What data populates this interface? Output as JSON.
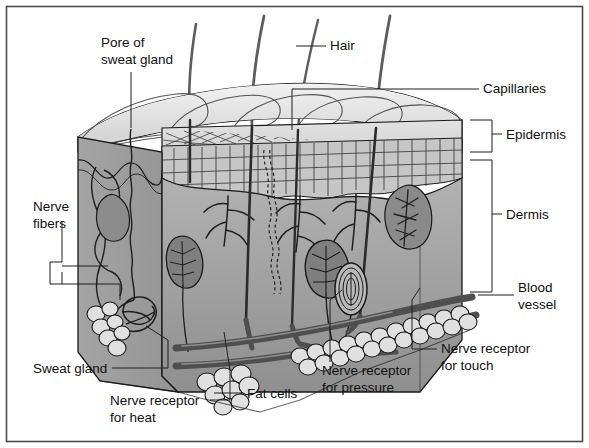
{
  "figure": {
    "border_color": "#4a4a4a",
    "background": "#ffffff"
  },
  "palette": {
    "outline": "#1a1a1a",
    "top_surface": "#ececec",
    "top_surface_shade": "#d6d6d6",
    "epidermis_band": "#d8d8d8",
    "epidermis_cells": "#c9c9c9",
    "dermis_left": "#9b9b9b",
    "dermis_front": "#a8a8a8",
    "dermis_front_dark": "#8e8e8e",
    "blood_vessel": "#585858",
    "fat_cell": "#dcdcdc",
    "hair": "#6a6a6a",
    "leader_line": "#2a2a2a"
  },
  "labels": [
    {
      "id": "pore-of-sweat-gland",
      "lines": [
        "Pore of",
        "sweat gland"
      ],
      "x": 101,
      "y": 47,
      "anchor": "start"
    },
    {
      "id": "hair",
      "lines": [
        "Hair"
      ],
      "x": 330,
      "y": 50,
      "anchor": "start"
    },
    {
      "id": "capillaries",
      "lines": [
        "Capillaries"
      ],
      "x": 483,
      "y": 93,
      "anchor": "start"
    },
    {
      "id": "epidermis",
      "lines": [
        "Epidermis"
      ],
      "x": 506,
      "y": 138,
      "anchor": "start"
    },
    {
      "id": "dermis",
      "lines": [
        "Dermis"
      ],
      "x": 506,
      "y": 218,
      "anchor": "start"
    },
    {
      "id": "nerve-fibers",
      "lines": [
        "Nerve",
        "fibers"
      ],
      "x": 33,
      "y": 211,
      "anchor": "start"
    },
    {
      "id": "blood-vessel",
      "lines": [
        "Blood",
        "vessel"
      ],
      "x": 518,
      "y": 292,
      "anchor": "start"
    },
    {
      "id": "sweat-gland",
      "lines": [
        "Sweat gland"
      ],
      "x": 33,
      "y": 372,
      "anchor": "start"
    },
    {
      "id": "nerve-receptor-for-touch",
      "lines": [
        "Nerve receptor",
        "for touch"
      ],
      "x": 441,
      "y": 353,
      "anchor": "start"
    },
    {
      "id": "nerve-receptor-for-pressure",
      "lines": [
        "Nerve receptor",
        "for pressure"
      ],
      "x": 322,
      "y": 375,
      "anchor": "start"
    },
    {
      "id": "fat-cells",
      "lines": [
        "Fat cells"
      ],
      "x": 247,
      "y": 397,
      "anchor": "start"
    },
    {
      "id": "nerve-receptor-for-heat",
      "lines": [
        "Nerve receptor",
        "for heat"
      ],
      "x": 110,
      "y": 404,
      "anchor": "start"
    }
  ],
  "structures": [
    {
      "id": "hair-shafts",
      "count": 4,
      "name": "Hair"
    },
    {
      "id": "epidermis-layer",
      "name": "Epidermis"
    },
    {
      "id": "dermis-layer",
      "name": "Dermis"
    },
    {
      "id": "subcutaneous-fat",
      "name": "Fat cells"
    },
    {
      "id": "sweat-gland-duct",
      "name": "Sweat gland duct"
    },
    {
      "id": "sweat-gland-coil",
      "name": "Sweat gland"
    },
    {
      "id": "blood-vessels",
      "name": "Blood vessel"
    },
    {
      "id": "capillary-network",
      "name": "Capillaries"
    },
    {
      "id": "pacinian-corpuscle",
      "name": "Nerve receptor for pressure"
    },
    {
      "id": "meissner-corpuscle",
      "name": "Nerve receptor for touch"
    },
    {
      "id": "ruffini-ending",
      "name": "Nerve receptor for heat"
    },
    {
      "id": "nerve-fiber-bundle",
      "name": "Nerve fibers"
    }
  ]
}
